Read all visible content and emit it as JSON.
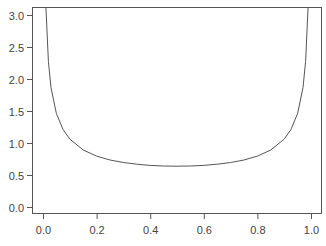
{
  "chart_data": {
    "type": "line",
    "title": "",
    "xlabel": "",
    "ylabel": "",
    "xlim": [
      -0.04,
      1.04
    ],
    "ylim": [
      -0.12,
      3.125
    ],
    "grid": false,
    "legend": null,
    "x_ticks": [
      0.0,
      0.2,
      0.4,
      0.6,
      0.8,
      1.0
    ],
    "x_tick_labels": [
      "0.0",
      "0.2",
      "0.4",
      "0.6",
      "0.8",
      "1.0"
    ],
    "y_ticks": [
      0.0,
      0.5,
      1.0,
      1.5,
      2.0,
      2.5,
      3.0
    ],
    "y_tick_labels": [
      "0.0",
      "0.5",
      "1.0",
      "1.5",
      "2.0",
      "2.5",
      "3.0"
    ],
    "series": [
      {
        "name": "density",
        "color": "#555555",
        "x": [
          0.005,
          0.01,
          0.02,
          0.03,
          0.05,
          0.075,
          0.1,
          0.15,
          0.2,
          0.25,
          0.3,
          0.35,
          0.4,
          0.45,
          0.5,
          0.55,
          0.6,
          0.65,
          0.7,
          0.75,
          0.8,
          0.85,
          0.9,
          0.925,
          0.95,
          0.97,
          0.98,
          0.99,
          0.995
        ],
        "y": [
          4.513,
          3.199,
          2.274,
          1.866,
          1.461,
          1.209,
          1.061,
          0.891,
          0.796,
          0.735,
          0.695,
          0.668,
          0.65,
          0.64,
          0.637,
          0.64,
          0.65,
          0.668,
          0.695,
          0.735,
          0.796,
          0.891,
          1.061,
          1.209,
          1.461,
          1.866,
          2.274,
          3.199,
          4.513
        ]
      }
    ]
  },
  "colors": {
    "axis": "#555555",
    "line": "#555555",
    "text": "#444444",
    "background": "#ffffff"
  }
}
